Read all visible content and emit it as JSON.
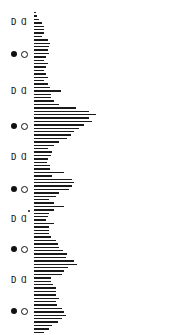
{
  "chart_data": {
    "type": "bar",
    "orientation": "horizontal",
    "title": "",
    "xlabel": "",
    "ylabel": "",
    "bar_color": "#1a1a1a",
    "bar_origin_x": 34,
    "row_start_y": 12,
    "row_spacing": 3.4,
    "values": [
      2,
      3,
      5,
      8,
      10,
      10,
      10,
      8,
      14,
      16,
      15,
      14,
      15,
      12,
      10,
      14,
      12,
      10,
      12,
      14,
      10,
      14,
      16,
      27,
      17,
      17,
      20,
      25,
      42,
      55,
      62,
      55,
      58,
      50,
      45,
      40,
      37,
      33,
      25,
      20,
      14,
      18,
      17,
      14,
      13,
      16,
      16,
      30,
      18,
      38,
      40,
      38,
      35,
      25,
      22,
      15,
      20,
      30,
      20,
      15,
      14,
      12,
      20,
      15,
      15,
      15,
      17,
      22,
      24,
      25,
      29,
      33,
      32,
      40,
      43,
      34,
      30,
      28,
      17,
      17,
      19,
      22,
      22,
      22,
      25,
      22,
      23,
      28,
      30,
      32,
      28,
      24,
      18,
      15,
      10,
      8,
      9,
      8,
      6
    ],
    "markers": [
      {
        "type": "quarter-pair",
        "label_left": "D",
        "label_right": "Ɑ",
        "y": 22
      },
      {
        "type": "full-new-pair",
        "y": 54
      },
      {
        "type": "quarter-pair",
        "label_left": "D",
        "label_right": "Ɑ",
        "y": 91
      },
      {
        "type": "full-new-pair",
        "y": 126
      },
      {
        "type": "quarter-pair",
        "label_left": "D",
        "label_right": "Ɑ",
        "y": 157
      },
      {
        "type": "full-new-pair",
        "y": 189
      },
      {
        "type": "quarter-pair",
        "label_left": "D",
        "label_right": "Ɑ",
        "y": 219
      },
      {
        "type": "full-new-pair",
        "y": 249
      },
      {
        "type": "quarter-pair",
        "label_left": "D",
        "label_right": "Ɑ",
        "y": 280
      },
      {
        "type": "full-new-pair",
        "y": 311
      }
    ],
    "annotations": [
      {
        "type": "small-dot",
        "x": 28,
        "y": 210
      }
    ]
  }
}
